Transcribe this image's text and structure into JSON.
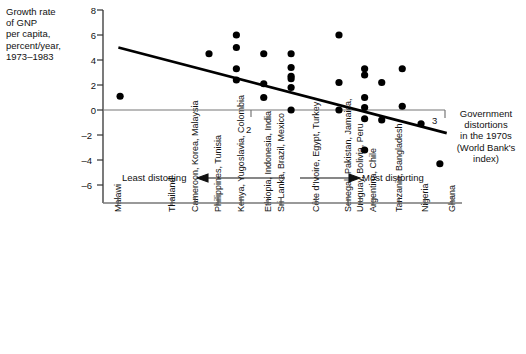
{
  "chart_data": {
    "type": "scatter",
    "title": "",
    "ylabel": "Growth rate of GNP per capita, percent/year, 1973–1983",
    "ylabel_lines": [
      "Growth rate",
      "of GNP",
      "per capita,",
      "percent/year,",
      "1973–1983"
    ],
    "xlabel": "Government distortions in the 1970s (World Bank's index)",
    "xlabel_lines": [
      "Government",
      "distortions",
      "in the 1970s",
      "(World Bank's",
      "index)"
    ],
    "ylim": [
      -7,
      8
    ],
    "yticks": [
      8,
      6,
      4,
      2,
      0,
      -2,
      -4,
      -6
    ],
    "ytick_labels": [
      "8",
      "6",
      "4",
      "2",
      "0",
      "–2",
      "–4",
      "–6"
    ],
    "xlim": [
      1.0,
      3.15
    ],
    "xticks_labeled": [
      2,
      3
    ],
    "xtick_labels": [
      "2",
      "3"
    ],
    "grid": false,
    "legend": null,
    "annotations": [
      {
        "name": "least-distorting",
        "text": "Least distorting",
        "direction": "left"
      },
      {
        "name": "most-distorting",
        "text": "Most distorting",
        "direction": "right"
      }
    ],
    "trendline": {
      "x0": 1.09,
      "y0": 5.0,
      "x1": 3.01,
      "y1": -1.85
    },
    "category_labels": [
      "Malawi",
      "Thailand",
      "Cameroon, Korea, Malaysia",
      "Philippines, Tunisia",
      "Kenya, Yugoslavia, Colombia",
      "Ethiopia, Indonesia, India",
      "Sri Lanka, Brazil, Mexico",
      "Côte d'Ivoire, Egypt, Turkey",
      "Senegal, Pakistan, Jamaica,",
      "Uruguay, Bolivia, Peru",
      "Argentina, Chile",
      "Tanzania, Bangladesh",
      "Nigeria",
      "Ghana"
    ],
    "points": [
      {
        "x": 1.1,
        "y": 1.1
      },
      {
        "x": 1.62,
        "y": 4.5
      },
      {
        "x": 1.78,
        "y": 6.0
      },
      {
        "x": 1.78,
        "y": 5.0
      },
      {
        "x": 1.78,
        "y": 3.3
      },
      {
        "x": 1.78,
        "y": 2.4
      },
      {
        "x": 1.94,
        "y": 4.5
      },
      {
        "x": 1.94,
        "y": 2.1
      },
      {
        "x": 1.94,
        "y": 1.0
      },
      {
        "x": 2.1,
        "y": 4.5
      },
      {
        "x": 2.1,
        "y": 3.4
      },
      {
        "x": 2.1,
        "y": 2.7
      },
      {
        "x": 2.1,
        "y": 2.5
      },
      {
        "x": 2.1,
        "y": 1.8
      },
      {
        "x": 2.1,
        "y": 0.0
      },
      {
        "x": 2.38,
        "y": 6.0
      },
      {
        "x": 2.38,
        "y": 2.2
      },
      {
        "x": 2.38,
        "y": 0.0
      },
      {
        "x": 2.53,
        "y": 3.3
      },
      {
        "x": 2.53,
        "y": 2.8
      },
      {
        "x": 2.53,
        "y": 1.0
      },
      {
        "x": 2.53,
        "y": 0.2
      },
      {
        "x": 2.53,
        "y": -0.7
      },
      {
        "x": 2.53,
        "y": -3.2
      },
      {
        "x": 2.63,
        "y": 2.2
      },
      {
        "x": 2.63,
        "y": -0.8
      },
      {
        "x": 2.75,
        "y": 3.3
      },
      {
        "x": 2.75,
        "y": 0.3
      },
      {
        "x": 2.86,
        "y": -1.1
      },
      {
        "x": 2.97,
        "y": -4.3
      }
    ]
  }
}
